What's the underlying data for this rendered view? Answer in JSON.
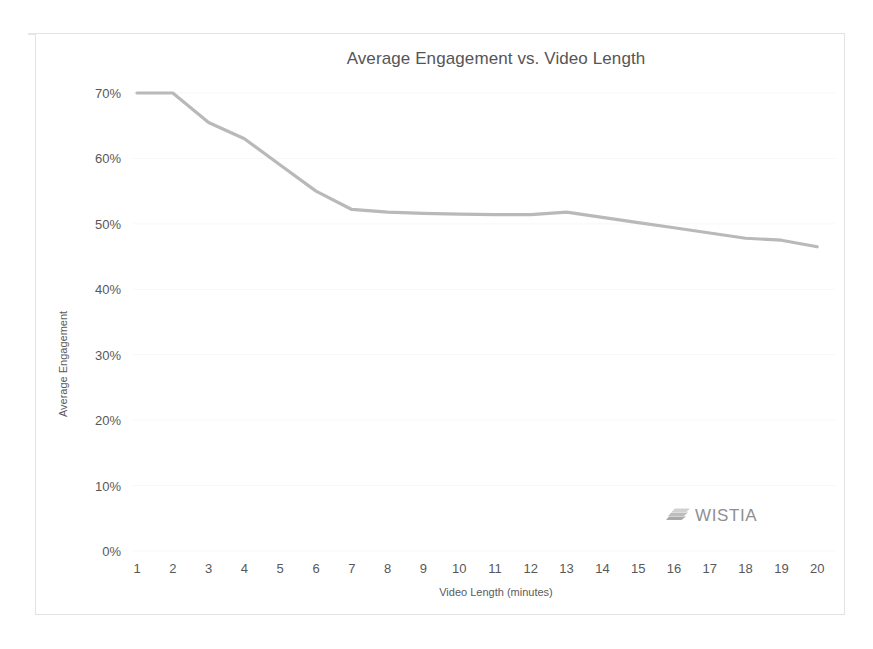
{
  "branding": {
    "logo_text": "WISTIA",
    "logo_mark_name": "wistia-swoosh-icon",
    "logo_color": "#8f8f93"
  },
  "colors": {
    "line": "#b9b9bc",
    "text": "#58585a",
    "title": "#555557",
    "grid": "#f7f7f9",
    "border": "#e3e3e6"
  },
  "chart_data": {
    "type": "line",
    "title": "Average Engagement vs. Video Length",
    "xlabel": "Video Length (minutes)",
    "ylabel": "Average Engagement",
    "grid": true,
    "legend": "none",
    "xlim": [
      1,
      20
    ],
    "ylim": [
      0,
      70
    ],
    "x": [
      1,
      2,
      3,
      4,
      5,
      6,
      7,
      8,
      9,
      10,
      11,
      12,
      13,
      14,
      15,
      16,
      17,
      18,
      19,
      20
    ],
    "xtick_labels": [
      "1",
      "2",
      "3",
      "4",
      "5",
      "6",
      "7",
      "8",
      "9",
      "10",
      "11",
      "12",
      "13",
      "14",
      "15",
      "16",
      "17",
      "18",
      "19",
      "20"
    ],
    "ytick_values": [
      0,
      10,
      20,
      30,
      40,
      50,
      60,
      70
    ],
    "ytick_labels": [
      "0%",
      "10%",
      "20%",
      "30%",
      "40%",
      "50%",
      "60%",
      "70%"
    ],
    "series": [
      {
        "name": "Average Engagement",
        "values": [
          70.0,
          70.0,
          65.5,
          63.0,
          59.0,
          55.0,
          52.2,
          51.8,
          51.6,
          51.5,
          51.4,
          51.4,
          51.8,
          51.0,
          50.2,
          49.4,
          48.6,
          47.8,
          47.5,
          46.5
        ]
      }
    ]
  }
}
